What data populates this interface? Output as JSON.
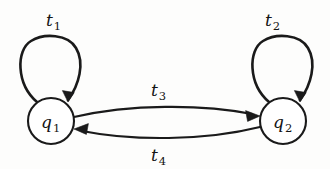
{
  "diagram": {
    "kind": "state-transition-diagram",
    "background_color": "#fdfdfc",
    "ink_color": "#1a1a1a",
    "states": [
      {
        "id": "q1",
        "base": "q",
        "subscript": "1",
        "cx": 51,
        "cy": 121,
        "r": 23
      },
      {
        "id": "q2",
        "base": "q",
        "subscript": "2",
        "cx": 283,
        "cy": 121,
        "r": 23
      }
    ],
    "transitions": [
      {
        "id": "t1",
        "base": "t",
        "subscript": "1",
        "from": "q1",
        "to": "q1",
        "shape": "self-loop",
        "label_x": 55,
        "label_y": 26
      },
      {
        "id": "t2",
        "base": "t",
        "subscript": "2",
        "from": "q2",
        "to": "q2",
        "shape": "self-loop",
        "label_x": 274,
        "label_y": 26
      },
      {
        "id": "t3",
        "base": "t",
        "subscript": "3",
        "from": "q1",
        "to": "q2",
        "shape": "arc-upper",
        "label_x": 159,
        "label_y": 96
      },
      {
        "id": "t4",
        "base": "t",
        "subscript": "4",
        "from": "q2",
        "to": "q1",
        "shape": "arc-lower",
        "label_x": 159,
        "label_y": 161
      }
    ]
  }
}
